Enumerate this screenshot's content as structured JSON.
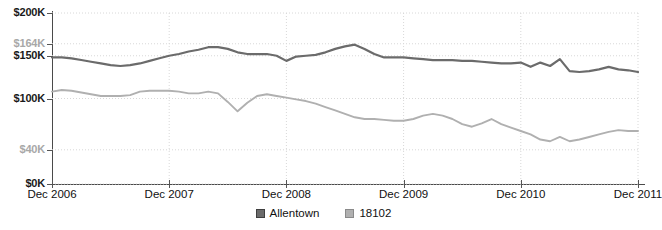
{
  "chart_data": {
    "type": "line",
    "title": "",
    "xlabel": "",
    "ylabel": "",
    "ylim": [
      0,
      200000
    ],
    "xlim": [
      "Dec 2006",
      "Dec 2011"
    ],
    "grid": true,
    "legend_position": "bottom-center",
    "y_ticks": [
      {
        "label": "$200K",
        "value": 200000,
        "muted": false
      },
      {
        "label": "$164K",
        "value": 164000,
        "muted": true
      },
      {
        "label": "$150K",
        "value": 150000,
        "muted": false
      },
      {
        "label": "$100K",
        "value": 100000,
        "muted": false
      },
      {
        "label": "$40K",
        "value": 40000,
        "muted": true
      },
      {
        "label": "$0K",
        "value": 0,
        "muted": false
      }
    ],
    "x_ticks": [
      {
        "label": "Dec 2006",
        "index": 0
      },
      {
        "label": "Dec 2007",
        "index": 12
      },
      {
        "label": "Dec 2008",
        "index": 24
      },
      {
        "label": "Dec 2009",
        "index": 36
      },
      {
        "label": "Dec 2010",
        "index": 48
      },
      {
        "label": "Dec 2011",
        "index": 60
      }
    ],
    "series": [
      {
        "name": "Allentown",
        "color": "#6b6b6b",
        "values": [
          148000,
          148000,
          147000,
          145000,
          143000,
          141000,
          139000,
          138000,
          139000,
          141000,
          144000,
          147000,
          150000,
          152000,
          155000,
          157000,
          160000,
          160000,
          158000,
          154000,
          152000,
          152000,
          152000,
          150000,
          144000,
          149000,
          150000,
          151000,
          154000,
          158000,
          161000,
          163000,
          158000,
          152000,
          148000,
          148000,
          148000,
          147000,
          146000,
          145000,
          145000,
          145000,
          144000,
          144000,
          143000,
          142000,
          141000,
          141000,
          142000,
          137000,
          142000,
          138000,
          146000,
          132000,
          131000,
          132000,
          134000,
          137000,
          134000,
          133000,
          131000
        ]
      },
      {
        "name": "18102",
        "color": "#b0b0b0",
        "values": [
          108000,
          110000,
          109000,
          107000,
          105000,
          103000,
          103000,
          103000,
          104000,
          108000,
          109000,
          109000,
          109000,
          108000,
          106000,
          106000,
          108000,
          106000,
          96000,
          85000,
          95000,
          103000,
          105000,
          103000,
          101000,
          99000,
          97000,
          94000,
          90000,
          86000,
          82000,
          78000,
          76000,
          76000,
          75000,
          74000,
          74000,
          76000,
          80000,
          82000,
          80000,
          76000,
          70000,
          67000,
          71000,
          76000,
          70000,
          66000,
          62000,
          58000,
          52000,
          50000,
          55000,
          50000,
          52000,
          55000,
          58000,
          61000,
          63000,
          62000,
          62000
        ]
      }
    ]
  },
  "legend": {
    "items": [
      {
        "label": "Allentown",
        "swatch": "dark-gray-square"
      },
      {
        "label": "18102",
        "swatch": "light-gray-square"
      }
    ]
  },
  "colors": {
    "series_allentown": "#6b6b6b",
    "series_18102": "#b0b0b0",
    "axis": "#4a4a4a",
    "gridline": "#d8d8d8",
    "label_text": "#111111",
    "label_muted": "#a8a8a8",
    "background": "#ffffff"
  }
}
